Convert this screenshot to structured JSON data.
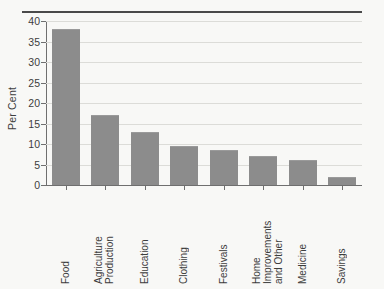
{
  "chart_data": {
    "type": "bar",
    "title": "",
    "xlabel": "",
    "ylabel": "Per Cent",
    "ylim": [
      0,
      40
    ],
    "yticks": [
      0,
      5,
      10,
      15,
      20,
      25,
      30,
      35,
      40
    ],
    "ytick_labels": [
      "0",
      "5",
      "10",
      "15",
      "20",
      "25",
      "30",
      "35",
      "40"
    ],
    "grid": true,
    "legend": "none",
    "categories": [
      "Food",
      "Agriculture\nProduction",
      "Education",
      "Clothing",
      "Festivals",
      "Home Improvements\nand Other",
      "Medicine",
      "Savings"
    ],
    "values": [
      38,
      17,
      13,
      9.5,
      8.5,
      7,
      6,
      2
    ],
    "bar_color": "#8c8c8c",
    "grid_color": "#dcdcd8",
    "axis_color": "#6f6f6f",
    "background_color": "#f8f8f6",
    "text_color": "#3d3d3d",
    "rule_color": "#4a4a4a"
  }
}
